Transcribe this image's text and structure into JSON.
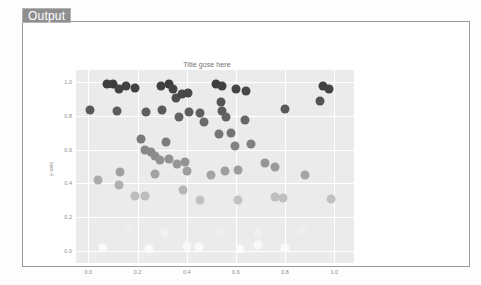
{
  "panel": {
    "tab_label": "Output"
  },
  "chart_data": {
    "type": "scatter",
    "title": "Title gose here",
    "xlabel": "",
    "ylabel": "y axis",
    "xlim": [
      -0.05,
      1.08
    ],
    "ylim": [
      -0.07,
      1.07
    ],
    "xticks": [
      "0.0",
      "0.2",
      "0.4",
      "0.6",
      "0.8",
      "1.0"
    ],
    "xtick_values": [
      0.0,
      0.2,
      0.4,
      0.6,
      0.8,
      1.0
    ],
    "yticks": [
      "1.0",
      "0.8",
      "0.6",
      "0.4",
      "0.2",
      "0.0"
    ],
    "ytick_values": [
      1.0,
      0.8,
      0.6,
      0.4,
      0.2,
      0.0
    ],
    "grid": true,
    "grid_color": "#ffffff",
    "plot_bgcolor": "#ebebeb",
    "colormap": "Greys",
    "colormap_note": "marker darkness increases with y value; dark gray near y=1.0, near-white near y=0.0",
    "marker_size_px": 9,
    "legend": null,
    "points": [
      {
        "x": 0.005,
        "y": 0.835,
        "c": "#5a5a5a"
      },
      {
        "x": 0.075,
        "y": 0.985,
        "c": "#3e3e3e"
      },
      {
        "x": 0.1,
        "y": 0.99,
        "c": "#3c3c3c"
      },
      {
        "x": 0.125,
        "y": 0.96,
        "c": "#434343"
      },
      {
        "x": 0.155,
        "y": 0.975,
        "c": "#414141"
      },
      {
        "x": 0.19,
        "y": 0.965,
        "c": "#424242"
      },
      {
        "x": 0.115,
        "y": 0.83,
        "c": "#5c5c5c"
      },
      {
        "x": 0.235,
        "y": 0.82,
        "c": "#5e5e5e"
      },
      {
        "x": 0.295,
        "y": 0.975,
        "c": "#414141"
      },
      {
        "x": 0.33,
        "y": 0.99,
        "c": "#3d3d3d"
      },
      {
        "x": 0.345,
        "y": 0.96,
        "c": "#444444"
      },
      {
        "x": 0.355,
        "y": 0.905,
        "c": "#4e4e4e"
      },
      {
        "x": 0.38,
        "y": 0.93,
        "c": "#4a4a4a"
      },
      {
        "x": 0.405,
        "y": 0.935,
        "c": "#494949"
      },
      {
        "x": 0.3,
        "y": 0.835,
        "c": "#5a5a5a"
      },
      {
        "x": 0.37,
        "y": 0.79,
        "c": "#636363"
      },
      {
        "x": 0.41,
        "y": 0.82,
        "c": "#5e5e5e"
      },
      {
        "x": 0.455,
        "y": 0.815,
        "c": "#5f5f5f"
      },
      {
        "x": 0.47,
        "y": 0.76,
        "c": "#6a6a6a"
      },
      {
        "x": 0.52,
        "y": 0.985,
        "c": "#3e3e3e"
      },
      {
        "x": 0.545,
        "y": 0.975,
        "c": "#414141"
      },
      {
        "x": 0.54,
        "y": 0.88,
        "c": "#545454"
      },
      {
        "x": 0.545,
        "y": 0.83,
        "c": "#5b5b5b"
      },
      {
        "x": 0.56,
        "y": 0.795,
        "c": "#626262"
      },
      {
        "x": 0.6,
        "y": 0.96,
        "c": "#444444"
      },
      {
        "x": 0.64,
        "y": 0.945,
        "c": "#474747"
      },
      {
        "x": 0.53,
        "y": 0.69,
        "c": "#757575"
      },
      {
        "x": 0.58,
        "y": 0.7,
        "c": "#737373"
      },
      {
        "x": 0.635,
        "y": 0.775,
        "c": "#676767"
      },
      {
        "x": 0.8,
        "y": 0.84,
        "c": "#595959"
      },
      {
        "x": 0.955,
        "y": 0.975,
        "c": "#414141"
      },
      {
        "x": 0.98,
        "y": 0.96,
        "c": "#444444"
      },
      {
        "x": 0.94,
        "y": 0.885,
        "c": "#535353"
      },
      {
        "x": 0.595,
        "y": 0.62,
        "c": "#828282"
      },
      {
        "x": 0.66,
        "y": 0.63,
        "c": "#7f7f7f"
      },
      {
        "x": 0.315,
        "y": 0.645,
        "c": "#7c7c7c"
      },
      {
        "x": 0.215,
        "y": 0.66,
        "c": "#7a7a7a"
      },
      {
        "x": 0.23,
        "y": 0.6,
        "c": "#868686"
      },
      {
        "x": 0.255,
        "y": 0.585,
        "c": "#898989"
      },
      {
        "x": 0.27,
        "y": 0.565,
        "c": "#8d8d8d"
      },
      {
        "x": 0.29,
        "y": 0.54,
        "c": "#929292"
      },
      {
        "x": 0.33,
        "y": 0.545,
        "c": "#919191"
      },
      {
        "x": 0.36,
        "y": 0.515,
        "c": "#969696"
      },
      {
        "x": 0.395,
        "y": 0.525,
        "c": "#949494"
      },
      {
        "x": 0.4,
        "y": 0.475,
        "c": "#9e9e9e"
      },
      {
        "x": 0.13,
        "y": 0.47,
        "c": "#9f9f9f"
      },
      {
        "x": 0.27,
        "y": 0.455,
        "c": "#a2a2a2"
      },
      {
        "x": 0.5,
        "y": 0.45,
        "c": "#a3a3a3"
      },
      {
        "x": 0.555,
        "y": 0.475,
        "c": "#9e9e9e"
      },
      {
        "x": 0.61,
        "y": 0.48,
        "c": "#9d9d9d"
      },
      {
        "x": 0.72,
        "y": 0.52,
        "c": "#959595"
      },
      {
        "x": 0.76,
        "y": 0.5,
        "c": "#999999"
      },
      {
        "x": 0.88,
        "y": 0.45,
        "c": "#a4a4a4"
      },
      {
        "x": 0.04,
        "y": 0.42,
        "c": "#ababab"
      },
      {
        "x": 0.125,
        "y": 0.39,
        "c": "#b0b0b0"
      },
      {
        "x": 0.19,
        "y": 0.325,
        "c": "#bdbdbd"
      },
      {
        "x": 0.23,
        "y": 0.325,
        "c": "#bdbdbd"
      },
      {
        "x": 0.385,
        "y": 0.36,
        "c": "#b6b6b6"
      },
      {
        "x": 0.455,
        "y": 0.305,
        "c": "#c1c1c1"
      },
      {
        "x": 0.61,
        "y": 0.3,
        "c": "#c2c2c2"
      },
      {
        "x": 0.76,
        "y": 0.32,
        "c": "#bebebe"
      },
      {
        "x": 0.79,
        "y": 0.315,
        "c": "#bfbfbf"
      },
      {
        "x": 0.985,
        "y": 0.31,
        "c": "#c0c0c0"
      },
      {
        "x": 0.165,
        "y": 0.13,
        "c": "#ededed"
      },
      {
        "x": 0.31,
        "y": 0.105,
        "c": "#f1f1f1"
      },
      {
        "x": 0.53,
        "y": 0.12,
        "c": "#efefef"
      },
      {
        "x": 0.69,
        "y": 0.11,
        "c": "#f0f0f0"
      },
      {
        "x": 0.87,
        "y": 0.125,
        "c": "#eeeeee"
      },
      {
        "x": 0.06,
        "y": 0.02,
        "c": "#fafafa"
      },
      {
        "x": 0.245,
        "y": 0.01,
        "c": "#fbfbfb"
      },
      {
        "x": 0.4,
        "y": 0.03,
        "c": "#f9f9f9"
      },
      {
        "x": 0.45,
        "y": 0.025,
        "c": "#f9f9f9"
      },
      {
        "x": 0.615,
        "y": 0.015,
        "c": "#fbfbfb"
      },
      {
        "x": 0.69,
        "y": 0.035,
        "c": "#f8f8f8"
      },
      {
        "x": 0.8,
        "y": 0.02,
        "c": "#fafafa"
      }
    ]
  }
}
